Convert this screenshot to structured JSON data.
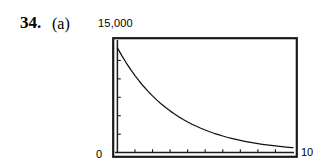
{
  "problem": {
    "number": "34.",
    "part": "(a)"
  },
  "labels": {
    "y_max": "15,000",
    "x_min": "0",
    "x_max": "10"
  },
  "chart_data": {
    "type": "line",
    "title": "",
    "xlabel": "",
    "ylabel": "",
    "xlim": [
      0,
      10
    ],
    "ylim": [
      0,
      15000
    ],
    "x_tick_labels": [
      "0",
      "10"
    ],
    "y_tick_labels": [
      "15,000"
    ],
    "x_minor_tick_count": 9,
    "y_minor_tick_count": 5,
    "grid": false,
    "legend": null,
    "frame": true,
    "series": [
      {
        "name": "exponential decay",
        "x": [
          0.0,
          0.25,
          0.5,
          0.75,
          1.0,
          1.25,
          1.5,
          1.75,
          2.0,
          2.25,
          2.5,
          2.75,
          3.0,
          3.25,
          3.5,
          3.75,
          4.0,
          4.25,
          4.5,
          4.75,
          5.0,
          5.25,
          5.5,
          5.75,
          6.0,
          6.25,
          6.5,
          6.75,
          7.0,
          7.25,
          7.5,
          7.75,
          8.0,
          8.25,
          8.5,
          8.75,
          9.0,
          9.25,
          9.5,
          9.75,
          10.0
        ],
        "y": [
          14200,
          13150,
          12180,
          11280,
          10450,
          9680,
          8960,
          8300,
          7690,
          7120,
          6590,
          6110,
          5660,
          5240,
          4850,
          4490,
          4160,
          3850,
          3570,
          3300,
          3060,
          2830,
          2620,
          2430,
          2250,
          2080,
          1930,
          1790,
          1655,
          1533,
          1420,
          1315,
          1218,
          1128,
          1044,
          967,
          896,
          829,
          768,
          711,
          660
        ]
      }
    ]
  }
}
